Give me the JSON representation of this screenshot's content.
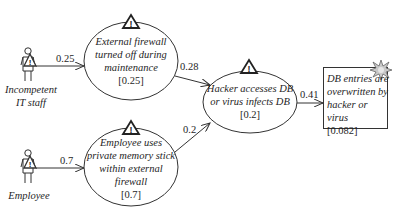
{
  "diagram": {
    "actors": [
      {
        "id": "incompetent-it-staff",
        "label_line1": "Incompetent",
        "label_line2": "IT staff"
      },
      {
        "id": "employee",
        "label_line1": "Employee"
      }
    ],
    "events": [
      {
        "id": "firewall-off",
        "lines": [
          "External firewall",
          "turned off during",
          "maintenance"
        ],
        "probability": "[0.25]"
      },
      {
        "id": "memory-stick",
        "lines": [
          "Employee uses",
          "private memory stick",
          "within external",
          "firewall"
        ],
        "probability": "[0.7]"
      },
      {
        "id": "hacker-access",
        "lines": [
          "Hacker accesses DB",
          "or virus infects DB"
        ],
        "probability": "[0.2]"
      }
    ],
    "outcome": {
      "id": "db-overwritten",
      "lines": [
        "DB entries are",
        "overwritten by",
        "hacker or virus"
      ],
      "probability": "[0.082]"
    },
    "edges": [
      {
        "from": "incompetent-it-staff",
        "to": "firewall-off",
        "weight": "0.25"
      },
      {
        "from": "employee",
        "to": "memory-stick",
        "weight": "0.7"
      },
      {
        "from": "firewall-off",
        "to": "hacker-access",
        "weight": "0.28"
      },
      {
        "from": "memory-stick",
        "to": "hacker-access",
        "weight": "0.2"
      },
      {
        "from": "hacker-access",
        "to": "db-overwritten",
        "weight": "0.41"
      }
    ],
    "icons": {
      "warning": "warning-triangle-icon",
      "actor": "person-icon",
      "outcome": "explosion-icon"
    },
    "colors": {
      "stroke": "#333333",
      "text": "#1e1e1e",
      "explosion": "#bfbfbf",
      "background": "#ffffff"
    }
  }
}
